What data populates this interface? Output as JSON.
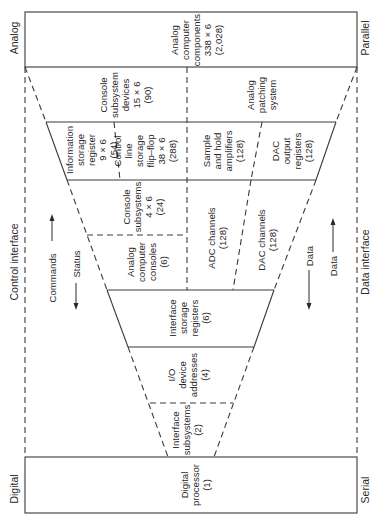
{
  "side_labels": {
    "analog": "Analog",
    "digital": "Digital",
    "parallel": "Parallel",
    "serial": "Serial",
    "control_interface": "Control interface",
    "data_interface": "Data interface"
  },
  "flows": {
    "commands": "Commands",
    "status": "Status",
    "data_down": "Data",
    "data_up": "Data"
  },
  "blocks": {
    "analog_components": [
      "Analog",
      "computer",
      "components",
      "338 × 6",
      "(2,028)"
    ],
    "console_subsystem_devices": [
      "Console",
      "subsystem",
      "devices",
      "15 × 6",
      "(90)"
    ],
    "analog_patching": [
      "Analog",
      "patching",
      "system"
    ],
    "info_storage_register": [
      "Information",
      "storage",
      "register",
      "9 × 6",
      "(54)"
    ],
    "control_line_storage": [
      "Control",
      "line",
      "storage",
      "flip–flop",
      "38 × 6",
      "(288)"
    ],
    "sample_hold": [
      "Sample",
      "and hold",
      "amplifiers",
      "(128)"
    ],
    "dac_output": [
      "DAC",
      "output",
      "registers",
      "(128)"
    ],
    "console_subsystems": [
      "Console",
      "subsystems",
      "4 × 6",
      "(24)"
    ],
    "analog_consoles": [
      "Analog",
      "computer",
      "consoles",
      "(6)"
    ],
    "adc_channels": [
      "ADC channels",
      "(128)"
    ],
    "dac_channels": [
      "DAC channels",
      "(128)"
    ],
    "interface_storage_registers": [
      "Interface",
      "storage",
      "registers",
      "(6)"
    ],
    "io_device_addresses": [
      "I/O",
      "device",
      "addresses",
      "(4)"
    ],
    "interface_subsystems": [
      "Interface",
      "subsystems",
      "(2)"
    ],
    "digital_processor": [
      "Digital",
      "processor",
      "(1)"
    ]
  }
}
